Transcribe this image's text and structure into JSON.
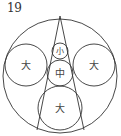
{
  "problem_number": "19",
  "diagram": {
    "stroke_color": "#333333",
    "outer_circle": {
      "cx": 60,
      "cy": 76,
      "r": 57
    },
    "triangle": {
      "apex": [
        60,
        16
      ],
      "left": [
        37,
        130
      ],
      "right": [
        84,
        130
      ]
    },
    "circles": [
      {
        "id": "small",
        "label": "小",
        "cx": 60,
        "cy": 51,
        "r": 8
      },
      {
        "id": "medium",
        "label": "中",
        "cx": 60,
        "cy": 73,
        "r": 13
      },
      {
        "id": "large-left",
        "label": "大",
        "cx": 26,
        "cy": 65,
        "r": 21
      },
      {
        "id": "large-right",
        "label": "大",
        "cx": 94,
        "cy": 65,
        "r": 21
      },
      {
        "id": "large-bottom",
        "label": "大",
        "cx": 60,
        "cy": 108,
        "r": 22
      }
    ]
  }
}
